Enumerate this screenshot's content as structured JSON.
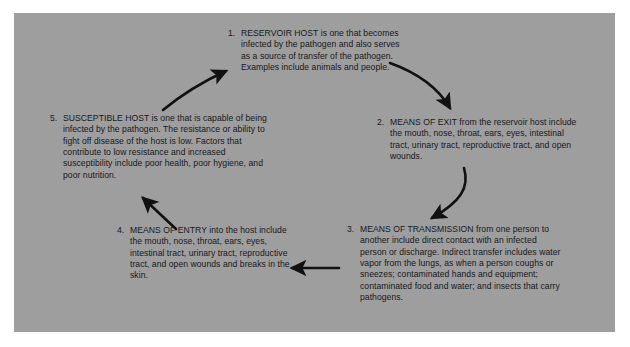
{
  "figure": {
    "panel_color": "#9e9e9e",
    "text_color": "#17181a",
    "arrow_color": "#111111"
  },
  "steps": [
    {
      "number": "1.",
      "heading": "RESERVOIR HOST",
      "text": "RESERVOIR HOST is one that becomes infected by the pathogen and also serves as a source of transfer of the pathogen. Examples include animals and people."
    },
    {
      "number": "2.",
      "heading": "MEANS OF EXIT",
      "text": "MEANS OF EXIT from the reservoir host include the mouth, nose, throat, ears, eyes, intestinal tract, urinary tract, reproductive tract, and open wounds."
    },
    {
      "number": "3.",
      "heading": "MEANS OF TRANSMISSION",
      "text": "MEANS OF TRANSMISSION from one person to another include direct contact with an infected person or discharge. Indirect transfer includes water vapor from the lungs, as when a person coughs or sneezes; contaminated hands and equipment; contaminated food and water; and insects that carry pathogens."
    },
    {
      "number": "4.",
      "heading": "MEANS OF ENTRY",
      "text": "MEANS OF ENTRY into the host include the mouth, nose, throat, ears, eyes, intestinal tract, urinary tract, reproductive tract, and open wounds and breaks in the skin."
    },
    {
      "number": "5.",
      "heading": "SUSCEPTIBLE HOST",
      "text": "SUSCEPTIBLE HOST is one that is capable of being infected by the pathogen. The resistance or ability to fight off disease of the host is low. Factors that contribute to low resistance and increased susceptibility include poor health, poor hygiene, and poor nutrition."
    }
  ],
  "arrows": [
    {
      "name": "arrow-5-to-1",
      "from": "5",
      "to": "1",
      "direction": "curve-up-right"
    },
    {
      "name": "arrow-1-to-2",
      "from": "1",
      "to": "2",
      "direction": "curve-down-right"
    },
    {
      "name": "arrow-2-to-3",
      "from": "2",
      "to": "3",
      "direction": "curve-down-left"
    },
    {
      "name": "arrow-3-to-4",
      "from": "3",
      "to": "4",
      "direction": "straight-left"
    },
    {
      "name": "arrow-4-to-5",
      "from": "4",
      "to": "5",
      "direction": "straight-up-left"
    }
  ]
}
